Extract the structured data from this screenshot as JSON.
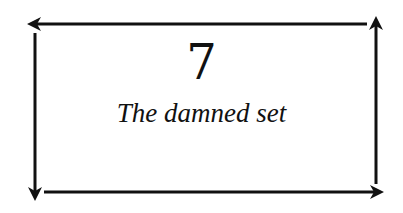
{
  "chapter": {
    "number": "7",
    "title": "The damned set"
  },
  "diagram": {
    "type": "cyclic-arrow-frame",
    "stroke_color": "#111111",
    "arrows": [
      {
        "edge": "top",
        "direction": "left"
      },
      {
        "edge": "left",
        "direction": "down"
      },
      {
        "edge": "bottom",
        "direction": "right"
      },
      {
        "edge": "right",
        "direction": "up"
      }
    ]
  }
}
